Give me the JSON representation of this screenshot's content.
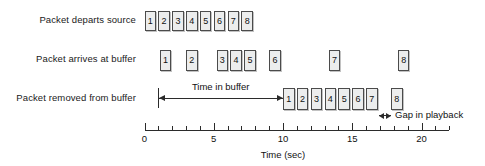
{
  "figure": {
    "axis_title": "Time (sec)"
  },
  "rows": [
    {
      "label": "Packet departs source"
    },
    {
      "label": "Packet arrives at buffer"
    },
    {
      "label": "Packet removed from buffer"
    }
  ],
  "annotations": {
    "time_in_buffer": "Time in buffer",
    "gap_in_playback": "Gap in playback"
  },
  "axis": {
    "ticks": [
      "0",
      "5",
      "10",
      "15",
      "20"
    ],
    "tick_values": [
      0,
      5,
      10,
      15,
      20
    ],
    "minor_step": 1,
    "min": 0,
    "max": 22
  },
  "chart_data": {
    "type": "timeline",
    "xlabel": "Time (sec)",
    "ylabel": "",
    "xlim": [
      0,
      22
    ],
    "grid": false,
    "legend": "none",
    "series": [
      {
        "name": "Packet departs source",
        "labels": [
          "1",
          "2",
          "3",
          "4",
          "5",
          "6",
          "7",
          "8"
        ],
        "x": [
          0,
          1,
          2,
          3,
          4,
          5,
          6,
          7
        ],
        "duration": 1
      },
      {
        "name": "Packet arrives at buffer",
        "labels": [
          "1",
          "2",
          "3",
          "4",
          "5",
          "6",
          "7",
          "8"
        ],
        "x": [
          1.1,
          3.0,
          5.2,
          6.2,
          7.2,
          9.0,
          13.3,
          18.3
        ],
        "duration": 1
      },
      {
        "name": "Packet removed from buffer",
        "labels": [
          "1",
          "2",
          "3",
          "4",
          "5",
          "6",
          "7",
          "8"
        ],
        "x": [
          10,
          11,
          12,
          13,
          14,
          15,
          16,
          17.8
        ],
        "duration": 1
      }
    ],
    "annotations": [
      {
        "text": "Time in buffer",
        "from": 1.0,
        "to": 10.0,
        "style": "double-arrow"
      },
      {
        "text": "Gap in playback",
        "from": 16.95,
        "to": 17.8,
        "style": "double-arrow"
      }
    ]
  },
  "colors": {
    "packet_fill": "#eceded",
    "packet_stroke": "#4b4b4b",
    "text": "#111111",
    "axis": "#2b2b2b",
    "background": "#ffffff"
  }
}
